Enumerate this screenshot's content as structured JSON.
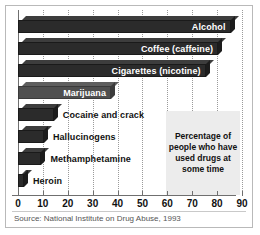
{
  "chart_data": {
    "type": "bar",
    "orientation": "horizontal",
    "title": "",
    "xlabel": "",
    "ylabel": "",
    "xlim": [
      0,
      90
    ],
    "xticks": [
      0,
      10,
      20,
      30,
      40,
      50,
      60,
      70,
      80,
      90
    ],
    "grid": true,
    "legend": false,
    "categories": [
      "Alcohol",
      "Coffee (caffeine)",
      "Cigarettes (nicotine)",
      "Marijuana",
      "Cocaine and crack",
      "Hallucinogens",
      "Methamphetamine",
      "Heroin"
    ],
    "values": [
      85,
      80,
      75,
      37,
      14,
      10,
      9,
      2
    ],
    "annotation": "Percentage of people who have used drugs at some time",
    "source": "Source: National Institute on Drug Abuse, 1993"
  },
  "bars": [
    {
      "label": "Alcohol",
      "value": 85,
      "label_inside": true,
      "shade": "dark"
    },
    {
      "label": "Coffee (caffeine)",
      "value": 80,
      "label_inside": true,
      "shade": "dark"
    },
    {
      "label": "Cigarettes (nicotine)",
      "value": 75,
      "label_inside": true,
      "shade": "dark"
    },
    {
      "label": "Marijuana",
      "value": 37,
      "label_inside": true,
      "shade": "light"
    },
    {
      "label": "Cocaine and crack",
      "value": 14,
      "label_inside": false,
      "shade": "dark"
    },
    {
      "label": "Hallucinogens",
      "value": 10,
      "label_inside": false,
      "shade": "dark"
    },
    {
      "label": "Methamphetamine",
      "value": 9,
      "label_inside": false,
      "shade": "dark"
    },
    {
      "label": "Heroin",
      "value": 2,
      "label_inside": false,
      "shade": "dark"
    }
  ],
  "callout": {
    "text": "Percentage of people who have used drugs at some time"
  },
  "axis": {
    "ticks": [
      "0",
      "10",
      "20",
      "30",
      "40",
      "50",
      "60",
      "70",
      "80",
      "90"
    ]
  },
  "footer": {
    "source": "Source: National Institute on Drug Abuse, 1993"
  },
  "colors": {
    "bar_dark": "#2b2b2b",
    "bar_light": "#4f4f4f",
    "callout_bg": "#ececec",
    "frame": "#b9b9b9",
    "grid": "#9a9a9a",
    "axis": "#6f6f6f",
    "text": "#111111",
    "source_text": "#555555",
    "bar_label_inside": "#ffffff"
  }
}
